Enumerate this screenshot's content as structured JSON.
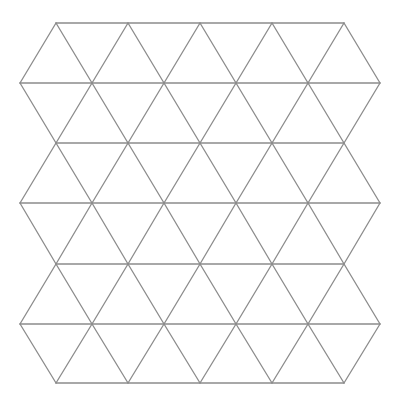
{
  "diagram": {
    "type": "triangular-grid",
    "stroke_color": "#8c8c8c",
    "stroke_width": 1.3,
    "background": "#ffffff",
    "rows_y": [
      23,
      83,
      143,
      203,
      264,
      324,
      383
    ],
    "even_row_x": [
      56,
      128,
      200,
      272,
      344
    ],
    "odd_row_x": [
      20,
      92,
      164,
      236,
      308,
      380
    ]
  }
}
